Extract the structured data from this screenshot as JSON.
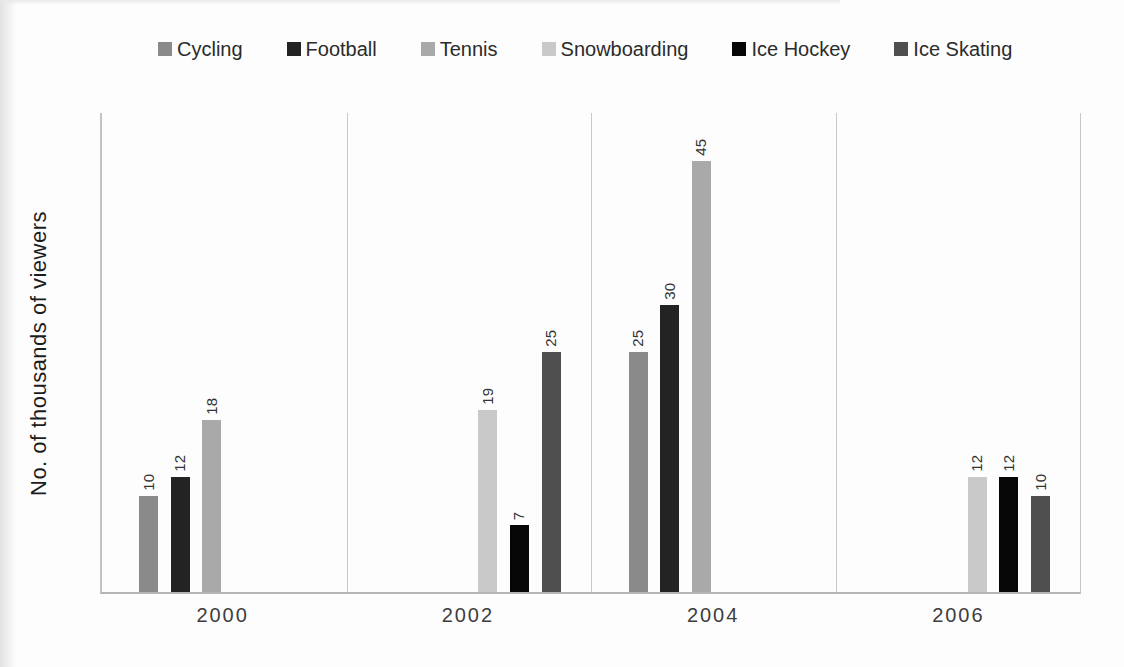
{
  "chart_data": {
    "type": "bar",
    "title": "",
    "xlabel": "",
    "ylabel": "No. of thousands of viewers",
    "ylim": [
      0,
      50
    ],
    "y_axis_ticks_visible": false,
    "grid": "vertical category separators only",
    "legend_position": "top",
    "data_label_rotation": -90,
    "categories": [
      "2000",
      "2002",
      "2004",
      "2006"
    ],
    "series": [
      {
        "name": "Cycling",
        "color": "#8a8a8a",
        "values": [
          10,
          null,
          25,
          null
        ]
      },
      {
        "name": "Football",
        "color": "#232323",
        "values": [
          12,
          null,
          30,
          null
        ]
      },
      {
        "name": "Tennis",
        "color": "#a9a9a9",
        "values": [
          18,
          null,
          45,
          null
        ]
      },
      {
        "name": "Snowboarding",
        "color": "#c9c9c9",
        "values": [
          null,
          19,
          null,
          12
        ]
      },
      {
        "name": "Ice Hockey",
        "color": "#060606",
        "values": [
          null,
          7,
          null,
          12
        ]
      },
      {
        "name": "Ice Skating",
        "color": "#4f4f4f",
        "values": [
          null,
          25,
          null,
          10
        ]
      }
    ],
    "colors": {
      "axis_line": "#b5b5b5",
      "separator_line": "#c9c9c9",
      "data_label_text": "#333333",
      "legend_text": "#2b2b2b",
      "axis_label_text": "#3d3d3d"
    }
  }
}
